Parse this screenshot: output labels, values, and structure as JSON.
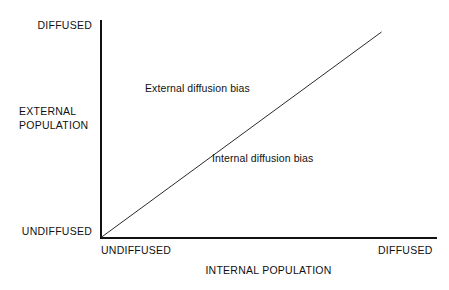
{
  "chart_data": {
    "type": "line",
    "title": "",
    "subtitle": "",
    "xlabel": "INTERNAL POPULATION",
    "ylabel": "EXTERNAL POPULATION",
    "ylabel_lines": [
      "EXTERNAL",
      "POPULATION"
    ],
    "xticks": [
      "UNDIFFUSED",
      "DIFFUSED"
    ],
    "yticks": [
      "UNDIFFUSED",
      "DIFFUSED"
    ],
    "xlim": [
      0,
      1
    ],
    "ylim": [
      0,
      1
    ],
    "grid": false,
    "legend": "none",
    "series": [
      {
        "name": "parity line",
        "description": "45-degree diagonal from origin",
        "x": [
          0,
          0.835
        ],
        "y": [
          0,
          0.945
        ]
      }
    ],
    "annotations": [
      {
        "text": "External diffusion bias",
        "region": "above-diagonal",
        "x": 0.135,
        "y": 0.73
      },
      {
        "text": "Internal diffusion bias",
        "region": "below-diagonal",
        "x": 0.335,
        "y": 0.41
      }
    ]
  },
  "axes": {
    "y": {
      "tick_top": "DIFFUSED",
      "tick_bottom": "UNDIFFUSED",
      "title_line1": "EXTERNAL",
      "title_line2": "POPULATION"
    },
    "x": {
      "tick_left": "UNDIFFUSED",
      "tick_right": "DIFFUSED",
      "title": "INTERNAL POPULATION"
    }
  },
  "regions": {
    "external": "External diffusion bias",
    "internal": "Internal diffusion bias"
  },
  "colors": {
    "background": "#ffffff",
    "axis": "#121212",
    "diagonal": "#2a2a2a",
    "text": "#111111"
  }
}
